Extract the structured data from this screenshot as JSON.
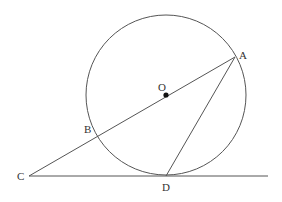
{
  "labels": {
    "A": "A",
    "B": "B",
    "C": "C",
    "D": "D",
    "O": "O"
  },
  "geometry": {
    "circle": {
      "cx": 166,
      "cy": 95,
      "r": 80
    },
    "points": {
      "A": [
        235,
        57
      ],
      "B": [
        97,
        136
      ],
      "C": [
        29,
        176
      ],
      "D": [
        166,
        176
      ],
      "O": [
        166,
        95
      ]
    },
    "segments": [
      [
        "C",
        "A"
      ],
      [
        "A",
        "D"
      ]
    ],
    "tangent_line": {
      "x1": 29,
      "x2": 268,
      "y": 176
    }
  },
  "colors": {
    "stroke": "#555555",
    "text": "#333333"
  }
}
